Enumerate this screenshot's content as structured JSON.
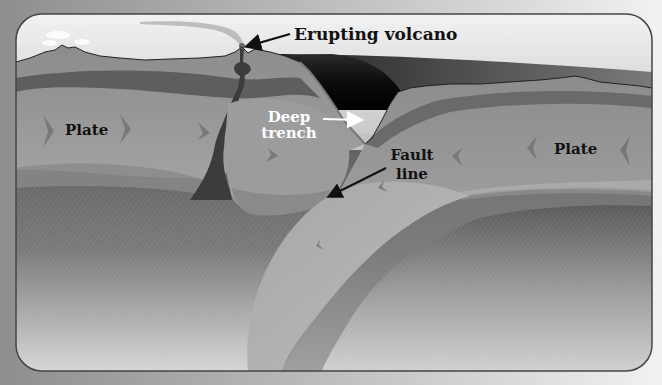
{
  "diagram": {
    "labels": {
      "volcano": "Erupting volcano",
      "trench_line1": "Deep",
      "trench_line2": "trench",
      "fault_line1": "Fault",
      "fault_line2": "line",
      "plate_left": "Plate",
      "plate_right": "Plate"
    },
    "icons": {
      "arrow_left_plate": "chevron-right",
      "arrow_right_plate": "chevron-left"
    },
    "colors": {
      "sky_top": "#f0f0f0",
      "sky_bottom": "#c8c8c8",
      "ocean_dark": "#111111",
      "crust": "#8a8a8a",
      "crust_dark": "#5e5e5e",
      "plate": "#9a9a9a",
      "mantle": "#6f6f6f",
      "magma": "#3c3c3c",
      "label_dark": "#111111",
      "label_light": "#ffffff",
      "frame_border": "#444444"
    }
  }
}
